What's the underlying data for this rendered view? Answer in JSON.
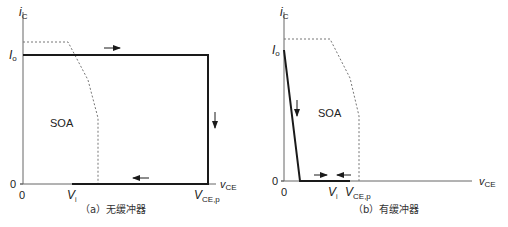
{
  "panels": [
    {
      "id": "a",
      "caption": "（a）无缓冲器",
      "y_axis_label": "i",
      "y_axis_sub": "C",
      "x_axis_label": "v",
      "x_axis_sub": "CE",
      "io_label": "I",
      "io_sub": "o",
      "y_zero": "0",
      "x_zero": "0",
      "vi_label": "V",
      "vi_sub": "i",
      "vcep_label": "V",
      "vcep_sub": "CE,p",
      "soa_label": "SOA",
      "arrows": [
        "right",
        "down",
        "left"
      ]
    },
    {
      "id": "b",
      "caption": "（b）有缓冲器",
      "y_axis_label": "i",
      "y_axis_sub": "C",
      "x_axis_label": "v",
      "x_axis_sub": "CE",
      "io_label": "I",
      "io_sub": "o",
      "y_zero": "0",
      "x_zero": "0",
      "vi_label": "V",
      "vi_sub": "i",
      "vcep_label": "V",
      "vcep_sub": "CE,p",
      "soa_label": "SOA",
      "arrows": [
        "down",
        "right",
        "left"
      ]
    }
  ],
  "colors": {
    "trajectory": "#1a1a1a",
    "axis": "#555555",
    "soa_boundary": "#777777"
  }
}
